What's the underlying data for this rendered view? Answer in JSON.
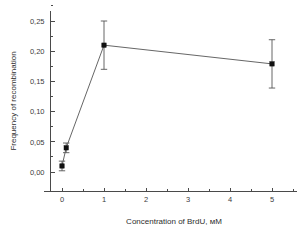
{
  "chart_data": {
    "type": "line",
    "title": "",
    "subtitle": "",
    "xlabel": "Concentration of BrdU, мM",
    "ylabel": "Frequency of recombination",
    "xlim": [
      -0.55,
      5.6
    ],
    "ylim": [
      -0.015,
      0.268
    ],
    "grid": false,
    "legend": null,
    "x_ticks": [
      "0",
      "1",
      "2",
      "3",
      "4",
      "5"
    ],
    "x_tick_values": [
      0,
      1,
      2,
      3,
      4,
      5
    ],
    "x_minor_ticks_per_interval": 1,
    "y_ticks": [
      "0,00",
      "0,05",
      "0,10",
      "0,15",
      "0,20",
      "0,25"
    ],
    "y_tick_values": [
      0.0,
      0.05,
      0.1,
      0.15,
      0.2,
      0.25
    ],
    "y_minor_ticks_per_interval": 1,
    "decimal_separator": ",",
    "marker": "filled-square",
    "error_bars": "symmetric",
    "series": [
      {
        "name": "Frequency of recombination",
        "color": "#111111",
        "line_color": "#555555",
        "points": [
          {
            "x": 0,
            "y": 0.01,
            "err": 0.008
          },
          {
            "x": 0.1,
            "y": 0.04,
            "err": 0.008
          },
          {
            "x": 1,
            "y": 0.21,
            "err": 0.04
          },
          {
            "x": 5,
            "y": 0.179,
            "err": 0.04
          }
        ]
      }
    ]
  },
  "axis": {
    "x_title": "Concentration of BrdU, мM",
    "y_title": "Frequency of recombination"
  }
}
